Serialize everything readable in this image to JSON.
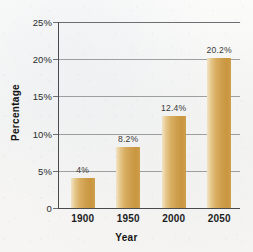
{
  "chart_data": {
    "type": "bar",
    "title": "",
    "xlabel": "Year",
    "ylabel": "Percentage",
    "categories": [
      "1900",
      "1950",
      "2000",
      "2050"
    ],
    "values": [
      4,
      8.2,
      12.4,
      20.2
    ],
    "data_labels": [
      "4%",
      "8.2%",
      "12.4%",
      "20.2%"
    ],
    "ylim": [
      0,
      25
    ],
    "ytick_values": [
      0,
      5,
      10,
      15,
      20,
      25
    ],
    "ytick_labels": [
      "0",
      "5%",
      "10%",
      "15%",
      "20%",
      "25%"
    ],
    "grid": true,
    "legend": false,
    "bar_color": "#cf9f4e",
    "bar_color_light": "#f0ddb8",
    "gridline_color": "#8d8f91",
    "axis_color": "#4a4b4f",
    "background_color": "#f7f7f6"
  }
}
